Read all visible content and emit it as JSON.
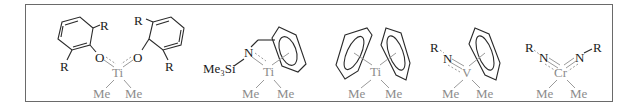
{
  "figure": {
    "colors": {
      "border": "#6a6a6a",
      "ligand_ink": "#1a1a1a",
      "metal_fragment": "#8c8c8c",
      "background": "#ffffff"
    },
    "structures": [
      {
        "id": "bis-aryloxide-titanium",
        "metal": "Ti",
        "labels": {
          "r_top_left": "R",
          "r_bottom_left": "R",
          "r_top_right": "R",
          "r_bottom_right": "R",
          "o_left": "O",
          "o_right": "O",
          "metal": "Ti",
          "me_left": "Me",
          "me_right": "Me"
        }
      },
      {
        "id": "silylamido-benzyl-titanium",
        "metal": "Ti",
        "labels": {
          "silyl": "Me₃Si",
          "n": "N",
          "metal": "Ti",
          "me_left": "Me",
          "me_right": "Me"
        }
      },
      {
        "id": "bis-arene-titanium",
        "metal": "Ti",
        "labels": {
          "metal": "Ti",
          "me_left": "Me",
          "me_right": "Me"
        }
      },
      {
        "id": "imido-arene-vanadium",
        "metal": "V",
        "labels": {
          "r": "R",
          "n": "N",
          "metal": "V",
          "me_left": "Me",
          "me_right": "Me"
        }
      },
      {
        "id": "bis-imido-chromium",
        "metal": "Cr",
        "labels": {
          "r_left": "R",
          "n_left": "N",
          "r_right": "R",
          "n_right": "N",
          "metal": "Cr",
          "me_left": "Me",
          "me_right": "Me"
        }
      }
    ]
  }
}
